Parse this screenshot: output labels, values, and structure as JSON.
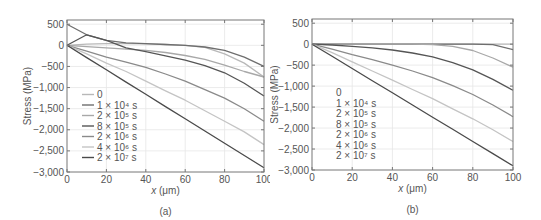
{
  "chart_data": [
    {
      "type": "line",
      "panel": "(a)",
      "title": "",
      "xlabel": "x (μm)",
      "ylabel": "Stress (MPa)",
      "xlim": [
        0,
        100
      ],
      "ylim": [
        -3000,
        600
      ],
      "xticks": [
        "0",
        "20",
        "40",
        "60",
        "80",
        "100"
      ],
      "yticks": [
        "500",
        "0",
        "−500",
        "−1,000",
        "−1,500",
        "−2,000",
        "−2,500",
        "−3,000"
      ],
      "grid": true,
      "legend_position": "lower-left inside",
      "x": [
        0,
        10,
        20,
        30,
        40,
        50,
        60,
        70,
        80,
        90,
        100
      ],
      "series": [
        {
          "name": "0",
          "color": "#b8b8b8",
          "values": [
            0,
            30,
            40,
            40,
            35,
            20,
            0,
            -50,
            -200,
            -420,
            -750
          ]
        },
        {
          "name": "1 × 10⁴ s",
          "color": "#6e6e6e",
          "values": [
            500,
            250,
            120,
            60,
            40,
            20,
            0,
            -40,
            -120,
            -280,
            -500
          ]
        },
        {
          "name": "2 × 10⁵ s",
          "color": "#a8a8a8",
          "values": [
            0,
            -30,
            -60,
            -90,
            -120,
            -170,
            -240,
            -330,
            -470,
            -620,
            -750
          ]
        },
        {
          "name": "8 × 10⁵ s",
          "color": "#555555",
          "values": [
            0,
            250,
            120,
            -60,
            -150,
            -250,
            -350,
            -480,
            -650,
            -900,
            -1200
          ]
        },
        {
          "name": "2 × 10⁶ s",
          "color": "#8a8a8a",
          "values": [
            0,
            -140,
            -280,
            -400,
            -520,
            -680,
            -850,
            -1050,
            -1250,
            -1500,
            -1800
          ]
        },
        {
          "name": "4 × 10⁶ s",
          "color": "#c4c4c4",
          "values": [
            0,
            -200,
            -420,
            -620,
            -850,
            -1080,
            -1300,
            -1550,
            -1800,
            -2050,
            -2350
          ]
        },
        {
          "name": "2 × 10⁷ s",
          "color": "#4a4a4a",
          "values": [
            0,
            -290,
            -580,
            -870,
            -1160,
            -1450,
            -1740,
            -2030,
            -2320,
            -2610,
            -2900
          ]
        }
      ]
    },
    {
      "type": "line",
      "panel": "(b)",
      "title": "",
      "xlabel": "x (μm)",
      "ylabel": "Stress (MPa)",
      "xlim": [
        0,
        100
      ],
      "ylim": [
        -3000,
        600
      ],
      "xticks": [
        "0",
        "20",
        "40",
        "60",
        "80",
        "100"
      ],
      "yticks": [
        "500",
        "0",
        "−500",
        "−1,000",
        "−1,500",
        "−2,000",
        "−2,500",
        "−3,000"
      ],
      "grid": true,
      "legend_position": "lower-left inside",
      "x": [
        0,
        10,
        20,
        30,
        40,
        50,
        60,
        70,
        80,
        90,
        100
      ],
      "series": [
        {
          "name": "0",
          "color": "#b8b8b8",
          "values": [
            0,
            0,
            0,
            0,
            0,
            0,
            0,
            0,
            0,
            0,
            0
          ]
        },
        {
          "name": "1 × 10⁴ s",
          "color": "#6e6e6e",
          "values": [
            0,
            0,
            0,
            0,
            0,
            0,
            0,
            0,
            0,
            -10,
            -130
          ]
        },
        {
          "name": "2 × 10⁵ s",
          "color": "#a8a8a8",
          "values": [
            0,
            0,
            0,
            0,
            0,
            0,
            -10,
            -50,
            -150,
            -330,
            -550
          ]
        },
        {
          "name": "8 × 10⁵ s",
          "color": "#555555",
          "values": [
            0,
            -20,
            -50,
            -90,
            -140,
            -210,
            -300,
            -440,
            -610,
            -840,
            -1100
          ]
        },
        {
          "name": "2 × 10⁶ s",
          "color": "#8a8a8a",
          "values": [
            0,
            -120,
            -250,
            -370,
            -500,
            -640,
            -800,
            -990,
            -1200,
            -1450,
            -1730
          ]
        },
        {
          "name": "4 × 10⁶ s",
          "color": "#c4c4c4",
          "values": [
            0,
            -200,
            -420,
            -640,
            -860,
            -1080,
            -1300,
            -1540,
            -1780,
            -2040,
            -2320
          ]
        },
        {
          "name": "2 × 10⁷ s",
          "color": "#4a4a4a",
          "values": [
            0,
            -290,
            -580,
            -870,
            -1160,
            -1450,
            -1740,
            -2030,
            -2320,
            -2610,
            -2900
          ]
        }
      ]
    }
  ],
  "panels": {
    "a": {
      "caption": "(a)",
      "ylabel": "Stress (MPa)",
      "xlabel_italic": "x",
      "xlabel_unit": " (μm)"
    },
    "b": {
      "caption": "(b)",
      "ylabel": "Stress (MPa)",
      "xlabel_italic": "x",
      "xlabel_unit": " (μm)"
    }
  }
}
